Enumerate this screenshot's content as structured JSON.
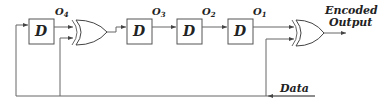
{
  "diagram": {
    "type": "circuit",
    "flipflops": [
      {
        "id": "ff4",
        "label": "D",
        "output_label": "O",
        "output_sub": "4"
      },
      {
        "id": "ff3",
        "label": "D",
        "output_label": "O",
        "output_sub": "3"
      },
      {
        "id": "ff2",
        "label": "D",
        "output_label": "O",
        "output_sub": "2"
      },
      {
        "id": "ff1",
        "label": "D",
        "output_label": "O",
        "output_sub": "1"
      }
    ],
    "gates": [
      {
        "id": "xor1",
        "type": "XOR"
      },
      {
        "id": "xor2",
        "type": "XOR"
      }
    ],
    "labels": {
      "output_line1": "Encoded",
      "output_line2": "Output",
      "input": "Data"
    },
    "colors": {
      "stroke": "#555555",
      "text": "#222222",
      "background": "#ffffff"
    }
  }
}
